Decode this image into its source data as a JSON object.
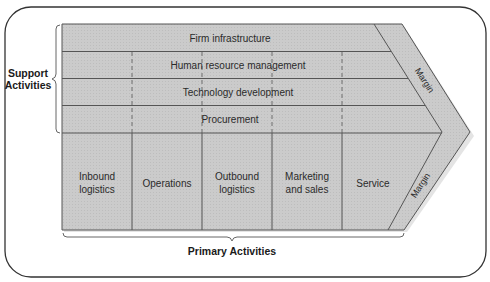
{
  "diagram": {
    "colors": {
      "fill": "#c9c9c9",
      "line": "#555555",
      "frame": "#333333",
      "text": "#2a2a2a"
    },
    "support_group_label_line1": "Support",
    "support_group_label_line2": "Activities",
    "primary_group_label": "Primary Activities",
    "support_activities": [
      {
        "label": "Firm infrastructure"
      },
      {
        "label": "Human resource management"
      },
      {
        "label": "Technology development"
      },
      {
        "label": "Procurement"
      }
    ],
    "primary_activities": [
      {
        "line1": "Inbound",
        "line2": "logistics"
      },
      {
        "line1": "Operations",
        "line2": ""
      },
      {
        "line1": "Outbound",
        "line2": "logistics"
      },
      {
        "line1": "Marketing",
        "line2": "and sales"
      },
      {
        "line1": "Service",
        "line2": ""
      }
    ],
    "margin_upper_label": "Margin",
    "margin_lower_label": "Margin"
  }
}
